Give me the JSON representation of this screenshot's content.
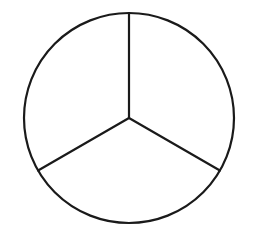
{
  "diagram": {
    "title": "",
    "shape": "circle",
    "divisions": 3,
    "colors": {
      "background": "#ffffff",
      "stroke": "#1a1a1a",
      "fill": "#ffffff"
    },
    "stroke_width": 2.2,
    "circle": {
      "cx": 129,
      "cy": 118,
      "r": 105
    },
    "spokes": [
      {
        "name": "spoke-top",
        "angle_deg": -90
      },
      {
        "name": "spoke-lower-right",
        "angle_deg": 30
      },
      {
        "name": "spoke-lower-left",
        "angle_deg": 150
      }
    ],
    "sectors": [
      {
        "name": "sector-upper-right",
        "fraction": "1/3"
      },
      {
        "name": "sector-bottom",
        "fraction": "1/3"
      },
      {
        "name": "sector-upper-left",
        "fraction": "1/3"
      }
    ]
  }
}
